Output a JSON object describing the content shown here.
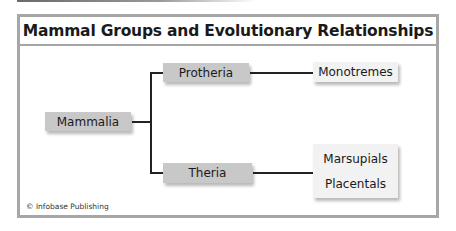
{
  "diagram": {
    "title": "Mammal Groups and Evolutionary Relationships",
    "credit": "© Infobase Publishing",
    "colors": {
      "frame_border": "#a6a6a6",
      "node_dark_fill": "#c8c8c8",
      "node_light_fill": "#f2f2f2",
      "connector": "#222222",
      "text": "#1a1a1a"
    },
    "nodes": {
      "root": {
        "label": "Mammalia"
      },
      "branch_top": {
        "label": "Protheria"
      },
      "branch_bottom": {
        "label": "Theria"
      },
      "leaf_top": {
        "label": "Monotremes"
      },
      "leaf_bottom": {
        "labels": [
          "Marsupials",
          "Placentals"
        ]
      }
    },
    "edges": [
      {
        "from": "Mammalia",
        "to": "Protheria"
      },
      {
        "from": "Mammalia",
        "to": "Theria"
      },
      {
        "from": "Protheria",
        "to": "Monotremes"
      },
      {
        "from": "Theria",
        "to": "Marsupials"
      },
      {
        "from": "Theria",
        "to": "Placentals"
      }
    ]
  }
}
